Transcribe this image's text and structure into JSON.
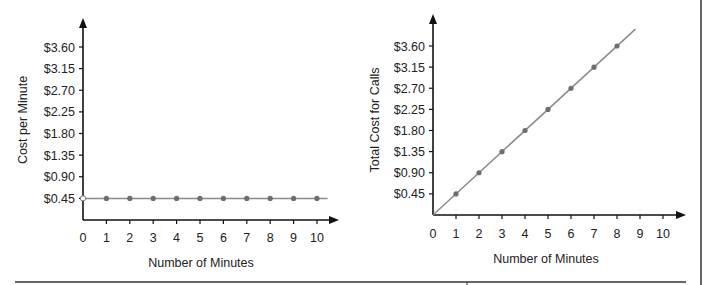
{
  "chart_data": [
    {
      "type": "line",
      "title": "",
      "xlabel": "Number of Minutes",
      "ylabel": "Cost per Minute",
      "x_ticks": [
        "0",
        "1",
        "2",
        "3",
        "4",
        "5",
        "6",
        "7",
        "8",
        "9",
        "10"
      ],
      "y_ticks": [
        "$0.45",
        "$0.90",
        "$1.35",
        "$1.80",
        "$2.25",
        "$2.70",
        "$3.15",
        "$3.60"
      ],
      "xlim": [
        0,
        10
      ],
      "ylim": [
        0,
        4.05
      ],
      "grid": false,
      "series": [
        {
          "name": "Cost per Minute",
          "x": [
            0,
            1,
            2,
            3,
            4,
            5,
            6,
            7,
            8,
            9,
            10
          ],
          "values": [
            0.45,
            0.45,
            0.45,
            0.45,
            0.45,
            0.45,
            0.45,
            0.45,
            0.45,
            0.45,
            0.45
          ],
          "open_point_at": 0
        }
      ]
    },
    {
      "type": "line",
      "title": "",
      "xlabel": "Number of Minutes",
      "ylabel": "Total Cost for Calls",
      "x_ticks": [
        "0",
        "1",
        "2",
        "3",
        "4",
        "5",
        "6",
        "7",
        "8",
        "9",
        "10"
      ],
      "y_ticks": [
        "$0.45",
        "$0.90",
        "$1.35",
        "$1.80",
        "$2.25",
        "$2.70",
        "$3.15",
        "$3.60"
      ],
      "xlim": [
        0,
        10
      ],
      "ylim": [
        0,
        4.05
      ],
      "grid": false,
      "series": [
        {
          "name": "Total Cost for Calls",
          "x": [
            1,
            2,
            3,
            4,
            5,
            6,
            7,
            8
          ],
          "values": [
            0.45,
            0.9,
            1.35,
            1.8,
            2.25,
            2.7,
            3.15,
            3.6
          ],
          "line_from": [
            0,
            0
          ],
          "line_to": [
            8.8,
            3.96
          ]
        }
      ]
    }
  ],
  "colors": {
    "axis": "#111111",
    "line": "#8a8a8a",
    "point": "#6e6e6e",
    "text": "#222222"
  }
}
